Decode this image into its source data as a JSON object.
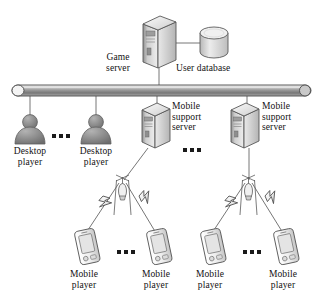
{
  "figure": {
    "kind": "network-architecture-diagram",
    "title_visible": false,
    "background_color": "#ffffff",
    "line_color": "#555555",
    "text_color": "#111111",
    "width": 323,
    "height": 307
  },
  "nodes": {
    "game_server": {
      "label": "Game\nserver",
      "icon": "server-tower-icon",
      "x": 143,
      "y": 17
    },
    "user_database": {
      "label": "User database",
      "icon": "database-cylinder-icon",
      "x": 197,
      "y": 28
    },
    "network_bus": {
      "label": "",
      "icon": "network-bus-icon",
      "x": 10,
      "y": 85
    },
    "desktop_player_1": {
      "label": "Desktop\nplayer",
      "icon": "person-icon",
      "x": 14,
      "y": 113
    },
    "desktop_player_2": {
      "label": "Desktop\nplayer",
      "icon": "person-icon",
      "x": 80,
      "y": 113
    },
    "mobile_support_server_1": {
      "label": "Mobile\nsupport\nserver",
      "icon": "server-tower-icon",
      "x": 142,
      "y": 103
    },
    "mobile_support_server_2": {
      "label": "Mobile\nsupport\nserver",
      "icon": "server-tower-icon",
      "x": 231,
      "y": 103
    },
    "antenna_1": {
      "label": "",
      "icon": "antenna-tower-icon",
      "x": 114,
      "y": 176
    },
    "antenna_2": {
      "label": "",
      "icon": "antenna-tower-icon",
      "x": 240,
      "y": 176
    },
    "mobile_player_1": {
      "label": "Mobile\nplayer",
      "icon": "mobile-phone-icon",
      "x": 74,
      "y": 232
    },
    "mobile_player_2": {
      "label": "Mobile\nplayer",
      "icon": "mobile-phone-icon",
      "x": 145,
      "y": 232
    },
    "mobile_player_3": {
      "label": "Mobile\nplayer",
      "icon": "mobile-phone-icon",
      "x": 200,
      "y": 232
    },
    "mobile_player_4": {
      "label": "Mobile\nplayer",
      "icon": "mobile-phone-icon",
      "x": 272,
      "y": 232
    }
  },
  "labels": {
    "game_server": "Game\nserver",
    "user_database": "User database",
    "desktop_player_1": "Desktop\nplayer",
    "desktop_player_2": "Desktop\nplayer",
    "mobile_support_server_1": "Mobile\nsupport\nserver",
    "mobile_support_server_2": "Mobile\nsupport\nserver",
    "mobile_player_1": "Mobile\nplayer",
    "mobile_player_2": "Mobile\nplayer",
    "mobile_player_3": "Mobile\nplayer",
    "mobile_player_4": "Mobile\nplayer"
  },
  "ellipses": [
    {
      "name": "desktop-players-ellipsis",
      "x": 52,
      "y": 134
    },
    {
      "name": "mobile-support-servers-ellipsis",
      "x": 183,
      "y": 148
    },
    {
      "name": "mobile-players-left-ellipsis",
      "x": 117,
      "y": 250
    },
    {
      "name": "mobile-players-right-ellipsis",
      "x": 243,
      "y": 250
    }
  ],
  "connections": [
    {
      "from": "game_server",
      "to": "user_database",
      "style": "solid"
    },
    {
      "from": "game_server",
      "to": "network_bus",
      "style": "solid"
    },
    {
      "from": "network_bus",
      "to": "desktop_player_1",
      "style": "solid"
    },
    {
      "from": "network_bus",
      "to": "desktop_player_2",
      "style": "solid"
    },
    {
      "from": "network_bus",
      "to": "mobile_support_server_1",
      "style": "solid"
    },
    {
      "from": "network_bus",
      "to": "mobile_support_server_2",
      "style": "solid"
    },
    {
      "from": "mobile_support_server_1",
      "to": "antenna_1",
      "style": "solid"
    },
    {
      "from": "mobile_support_server_2",
      "to": "antenna_2",
      "style": "solid"
    },
    {
      "from": "antenna_1",
      "to": "mobile_player_1",
      "style": "wireless"
    },
    {
      "from": "antenna_1",
      "to": "mobile_player_2",
      "style": "wireless"
    },
    {
      "from": "antenna_2",
      "to": "mobile_player_3",
      "style": "wireless"
    },
    {
      "from": "antenna_2",
      "to": "mobile_player_4",
      "style": "wireless"
    }
  ]
}
